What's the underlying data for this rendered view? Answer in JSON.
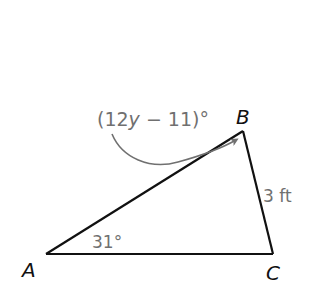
{
  "figure": {
    "type": "triangle",
    "vertices": {
      "A": {
        "label": "A",
        "x": 46,
        "y": 254
      },
      "B": {
        "label": "B",
        "x": 243,
        "y": 131
      },
      "C": {
        "label": "C",
        "x": 273,
        "y": 254
      }
    },
    "angle_A": "31°",
    "angle_B_expr": "(12y − 11)°",
    "angle_B_parts": {
      "open": "(12",
      "var": "y",
      "rest": " − 11)°"
    },
    "side_BC": "3 ft",
    "colors": {
      "line": "#111111",
      "annotation": "#707070",
      "vertex_label": "#111111"
    }
  }
}
